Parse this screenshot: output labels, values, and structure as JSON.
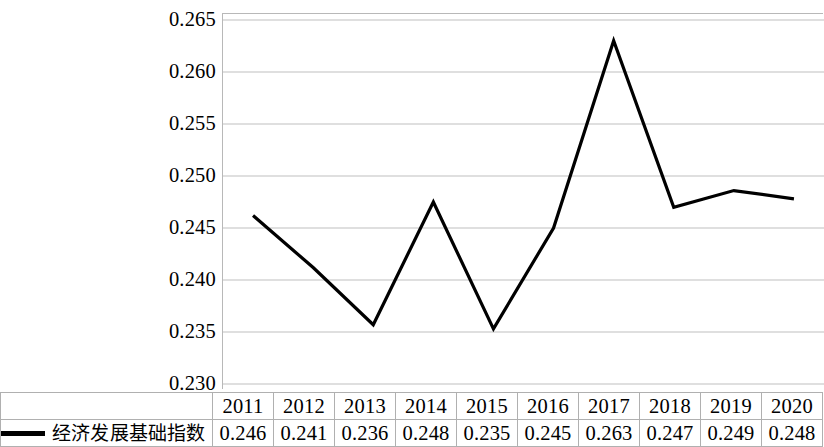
{
  "chart_data": {
    "type": "line",
    "title": "",
    "subtitle": "",
    "xlabel": "",
    "ylabel": "",
    "categories": [
      "2011",
      "2012",
      "2013",
      "2014",
      "2015",
      "2016",
      "2017",
      "2018",
      "2019",
      "2020"
    ],
    "series": [
      {
        "name": "经济发展基础指数",
        "values": [
          0.2462,
          0.2412,
          0.2357,
          0.2475,
          0.2353,
          0.245,
          0.263,
          0.247,
          0.2486,
          0.2478
        ],
        "table_values": [
          "0.246",
          "0.241",
          "0.236",
          "0.248",
          "0.235",
          "0.245",
          "0.263",
          "0.247",
          "0.249",
          "0.248"
        ],
        "color": "#000000"
      }
    ],
    "ylim": [
      0.23,
      0.265
    ],
    "yticks": [
      0.23,
      0.235,
      0.24,
      0.245,
      0.25,
      0.255,
      0.26,
      0.265
    ],
    "ytick_labels": [
      "0.230",
      "0.235",
      "0.240",
      "0.245",
      "0.250",
      "0.255",
      "0.260",
      "0.265"
    ],
    "grid": "horizontal",
    "legend_position": "bottom-left-table"
  },
  "legend": {
    "label": "经济发展基础指数",
    "swatch_name": "line-swatch"
  },
  "table": {
    "year_row": [
      "2011",
      "2012",
      "2013",
      "2014",
      "2015",
      "2016",
      "2017",
      "2018",
      "2019",
      "2020"
    ],
    "value_row": [
      "0.246",
      "0.241",
      "0.236",
      "0.248",
      "0.235",
      "0.245",
      "0.263",
      "0.247",
      "0.249",
      "0.248"
    ]
  },
  "axis": {
    "y_labels": [
      "0.265",
      "0.260",
      "0.255",
      "0.250",
      "0.245",
      "0.240",
      "0.235",
      "0.230"
    ]
  },
  "colors": {
    "line": "#000000",
    "gridline": "#bfbfbf",
    "axis": "#b8b8b8",
    "table_border": "#b0b0b0",
    "background": "#ffffff"
  }
}
